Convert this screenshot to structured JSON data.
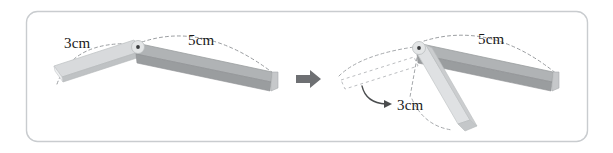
{
  "figure": {
    "panel_border_color": "#c9cccf",
    "background_color": "#ffffff",
    "caption": "",
    "left_diagram": {
      "name": "folding-ruler-open",
      "pivot_label": "pivot",
      "arms": [
        {
          "name": "arm-3cm",
          "label": "3cm",
          "length_cm": 3,
          "fill_color": "#d2d4d6",
          "edge_color": "#e9eaec"
        },
        {
          "name": "arm-5cm",
          "label": "5cm",
          "length_cm": 5,
          "fill_color": "#a8abad",
          "edge_color": "#cfd1d3"
        }
      ],
      "arc_style": "dashed"
    },
    "transition": {
      "name": "transition-arrow",
      "glyph": "arrow-right",
      "color": "#6e7073"
    },
    "right_diagram": {
      "name": "folding-ruler-folded",
      "pivot_label": "pivot",
      "arms": [
        {
          "name": "arm-5cm",
          "label": "5cm",
          "length_cm": 5,
          "fill_color": "#a8abad",
          "edge_color": "#cfd1d3"
        },
        {
          "name": "arm-3cm",
          "label": "3cm",
          "length_cm": 3,
          "fill_color": "#d2d4d6",
          "edge_color": "#f0f1f2"
        }
      ],
      "ghost_outline": {
        "name": "ghost-original-position",
        "style": "dashed",
        "color": "#b9bbbe"
      },
      "rotation_arrow": {
        "name": "rotation-arrow",
        "style": "curved-arrow",
        "color": "#4a4c4e"
      },
      "arc_style": "dashed"
    },
    "labels": {
      "left_3cm": "3cm",
      "left_5cm": "5cm",
      "right_5cm": "5cm",
      "right_3cm": "3cm"
    }
  }
}
